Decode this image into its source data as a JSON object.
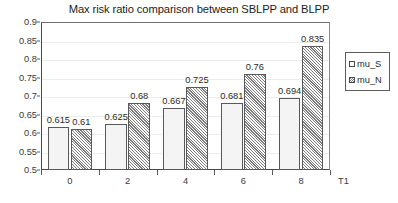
{
  "chart_data": {
    "type": "bar",
    "title": "Max risk ratio comparison between SBLPP and BLPP",
    "xlabel": "T1",
    "ylabel": "",
    "categories": [
      "0",
      "2",
      "4",
      "6",
      "8"
    ],
    "series": [
      {
        "name": "mu_S",
        "values": [
          0.615,
          0.625,
          0.667,
          0.681,
          0.694
        ]
      },
      {
        "name": "mu_N",
        "values": [
          0.61,
          0.68,
          0.725,
          0.76,
          0.835
        ]
      }
    ],
    "data_labels": [
      [
        "0.615",
        "0.625",
        "0.667",
        "0.681",
        "0.694"
      ],
      [
        "0.61",
        "0.68",
        "0.725",
        "0.76",
        "0.835"
      ]
    ],
    "ylim": [
      0.5,
      0.9
    ],
    "ytick_labels": [
      "0.9",
      "0.85",
      "0.8",
      "0.75",
      "0.7",
      "0.65",
      "0.6",
      "0.55",
      "0.5"
    ],
    "ytick_values": [
      0.9,
      0.85,
      0.8,
      0.75,
      0.7,
      0.65,
      0.6,
      0.55,
      0.5
    ],
    "grid": true,
    "legend_position": "right",
    "colors": {
      "series_0_fill": "#f4f4f4",
      "series_1_fill": "#ffffff",
      "series_1_hatch": "#7d7d7d",
      "bar_border": "#58595b",
      "axis": "#4a4a4a",
      "gridline": "#ececed",
      "text": "#2b2b2b",
      "background": "#ffffff"
    }
  }
}
